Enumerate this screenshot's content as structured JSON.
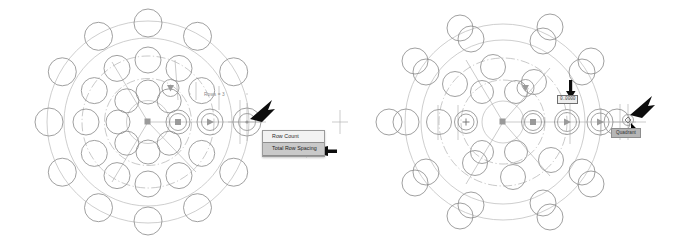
{
  "app": {
    "title": "Polar Array Grip Editing",
    "background_color": "#ffffff"
  },
  "colors": {
    "object_stroke": "#8f8f8f",
    "construction_ring": "#b9b9b9",
    "grip_fill": "#9a9a9a",
    "menu_background": "#f2f2f2",
    "menu_selected_background": "#c9c9c9",
    "tooltip_background": "#b6b6b6",
    "arrow_black": "#0d0d0d",
    "label_text": "#8a8a8a"
  },
  "panels": [
    {
      "id": "left",
      "name": "before-state",
      "dimension_label": "Rows = 3",
      "context_menu": {
        "name": "grip-context-menu",
        "items": [
          {
            "label": "Row Count",
            "selected": false
          },
          {
            "label": "Total Row Spacing",
            "selected": true
          }
        ]
      },
      "annotations": [
        {
          "name": "pointer-arrow-to-grip",
          "type": "arrow"
        },
        {
          "name": "pointer-arrow-to-menu-item",
          "type": "arrow"
        }
      ],
      "grips": [
        {
          "name": "base-point-grip",
          "shape": "square"
        },
        {
          "name": "row-count-grip",
          "shape": "square-circled"
        },
        {
          "name": "item-count-grip",
          "shape": "triangle-circled"
        },
        {
          "name": "row-spacing-grip",
          "shape": "crosshair-circled"
        },
        {
          "name": "level-grip",
          "shape": "triangle-down-circled"
        }
      ],
      "array": {
        "type": "polar",
        "rings": 3,
        "items_per_ring": 12
      }
    },
    {
      "id": "right",
      "name": "after-state",
      "dynamic_input": {
        "name": "row-spacing-input",
        "value": "0.0000"
      },
      "tooltip": {
        "name": "quadrant-osnap-tooltip",
        "label": "Quadrant"
      },
      "annotations": [
        {
          "name": "pointer-arrow-to-input",
          "type": "arrow"
        },
        {
          "name": "pointer-arrow-to-osnap",
          "type": "arrow"
        }
      ],
      "grips": [
        {
          "name": "base-point-grip",
          "shape": "square"
        },
        {
          "name": "row-count-grip",
          "shape": "square-circled"
        },
        {
          "name": "item-count-grip",
          "shape": "triangle-circled"
        },
        {
          "name": "row-spacing-grip",
          "shape": "crosshair-circled"
        },
        {
          "name": "level-grip",
          "shape": "triangle-down-circled"
        },
        {
          "name": "plus-grip",
          "shape": "plus-circled"
        }
      ],
      "array": {
        "type": "polar",
        "rings": 3,
        "items_per_ring": 12,
        "state": "compressed"
      }
    }
  ]
}
